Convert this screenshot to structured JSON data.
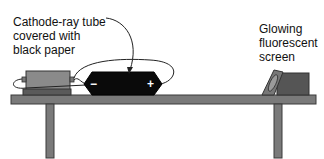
{
  "figure": {
    "labels": {
      "tube": [
        "Cathode-ray tube",
        "covered with",
        "black paper"
      ],
      "screen": [
        "Glowing",
        "fluorescent",
        "screen"
      ]
    },
    "tube_signs": {
      "negative": "−",
      "positive": "+"
    },
    "colors": {
      "table": "#7a7a7a",
      "table_edge": "#3a3a3a",
      "tube": "#0a0a0a",
      "power_supply": "#8a8a8a",
      "screen_frame": "#6e6e6e",
      "screen_box": "#555555"
    }
  }
}
